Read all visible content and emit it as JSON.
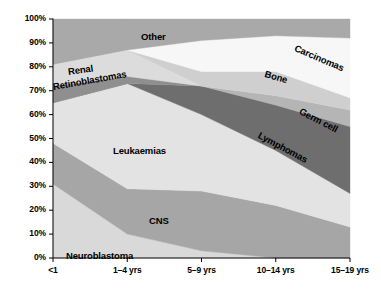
{
  "chart_data": {
    "type": "area",
    "title": "",
    "subtitle": "",
    "xlabel": "",
    "ylabel": "",
    "stacked": true,
    "stack_mode": "percent",
    "grid": false,
    "legend": "inline-labels",
    "ylim": [
      0,
      100
    ],
    "ytick_labels": [
      "0%",
      "10%",
      "20%",
      "30%",
      "40%",
      "50%",
      "60%",
      "70%",
      "80%",
      "90%",
      "100%"
    ],
    "ytick_values": [
      0,
      10,
      20,
      30,
      40,
      50,
      60,
      70,
      80,
      90,
      100
    ],
    "categories": [
      "<1",
      "1–4 yrs",
      "5–9 yrs",
      "10–14 yrs",
      "15–19 yrs"
    ],
    "series": [
      {
        "name": "Neuroblastoma",
        "color": "#d9d9d9",
        "values": [
          31,
          10,
          3,
          0,
          0
        ]
      },
      {
        "name": "CNS",
        "color": "#a6a6a6",
        "values": [
          17,
          19,
          25,
          22,
          13
        ]
      },
      {
        "name": "Leukaemias",
        "color": "#e3e3e3",
        "values": [
          17,
          44,
          32,
          23,
          14
        ]
      },
      {
        "name": "Lymphomas",
        "color": "#6e6e6e",
        "values": [
          0,
          0,
          12,
          19,
          28
        ]
      },
      {
        "name": "Retinoblastomas",
        "color": "#8f8f8f",
        "values": [
          7,
          3,
          0,
          0,
          0
        ]
      },
      {
        "name": "Germ cell",
        "color": "#b5b5b5",
        "values": [
          0,
          0,
          0,
          4,
          7
        ]
      },
      {
        "name": "Renal",
        "color": "#dcdcdc",
        "values": [
          9,
          11,
          0,
          0,
          0
        ]
      },
      {
        "name": "Bone",
        "color": "#cfcfcf",
        "values": [
          0,
          0,
          6,
          10,
          5
        ]
      },
      {
        "name": "Carcinomas",
        "color": "#f7f7f7",
        "values": [
          0,
          0,
          13,
          15,
          25
        ]
      },
      {
        "name": "Other",
        "color": "#a9a9a9",
        "values": [
          19,
          13,
          9,
          7,
          8
        ]
      }
    ],
    "series_labels": [
      {
        "text": "Other",
        "x": 141,
        "y": 31,
        "rotate": 0
      },
      {
        "text": "Renal",
        "x": 68,
        "y": 66,
        "rotate": -8
      },
      {
        "text": "Retinoblastomas",
        "x": 53,
        "y": 81,
        "rotate": -10
      },
      {
        "text": "Leukaemias",
        "x": 113,
        "y": 145,
        "rotate": 0
      },
      {
        "text": "CNS",
        "x": 149,
        "y": 215,
        "rotate": 0
      },
      {
        "text": "Neuroblastoma",
        "x": 66,
        "y": 250,
        "rotate": 0
      },
      {
        "text": "Lymphomas",
        "x": 259,
        "y": 129,
        "rotate": 28
      },
      {
        "text": "Bone",
        "x": 265,
        "y": 68,
        "rotate": 16
      },
      {
        "text": "Germ cell",
        "x": 300,
        "y": 105,
        "rotate": 27
      },
      {
        "text": "Carcinomas",
        "x": 295,
        "y": 42,
        "rotate": 23
      }
    ],
    "axis_color": "#000000",
    "plot_bounds": {
      "left": 53,
      "right": 350,
      "top": 19,
      "bottom": 258
    }
  }
}
